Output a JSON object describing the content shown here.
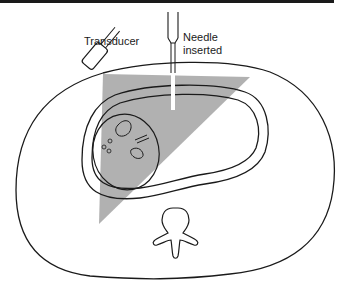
{
  "figure": {
    "labels": {
      "transducer": "Transducer",
      "needle_line1": "Needle",
      "needle_line2": "inserted"
    },
    "colors": {
      "stroke": "#1a1a1a",
      "ultrasound_beam": "#a8a8a8",
      "background": "#ffffff"
    }
  }
}
